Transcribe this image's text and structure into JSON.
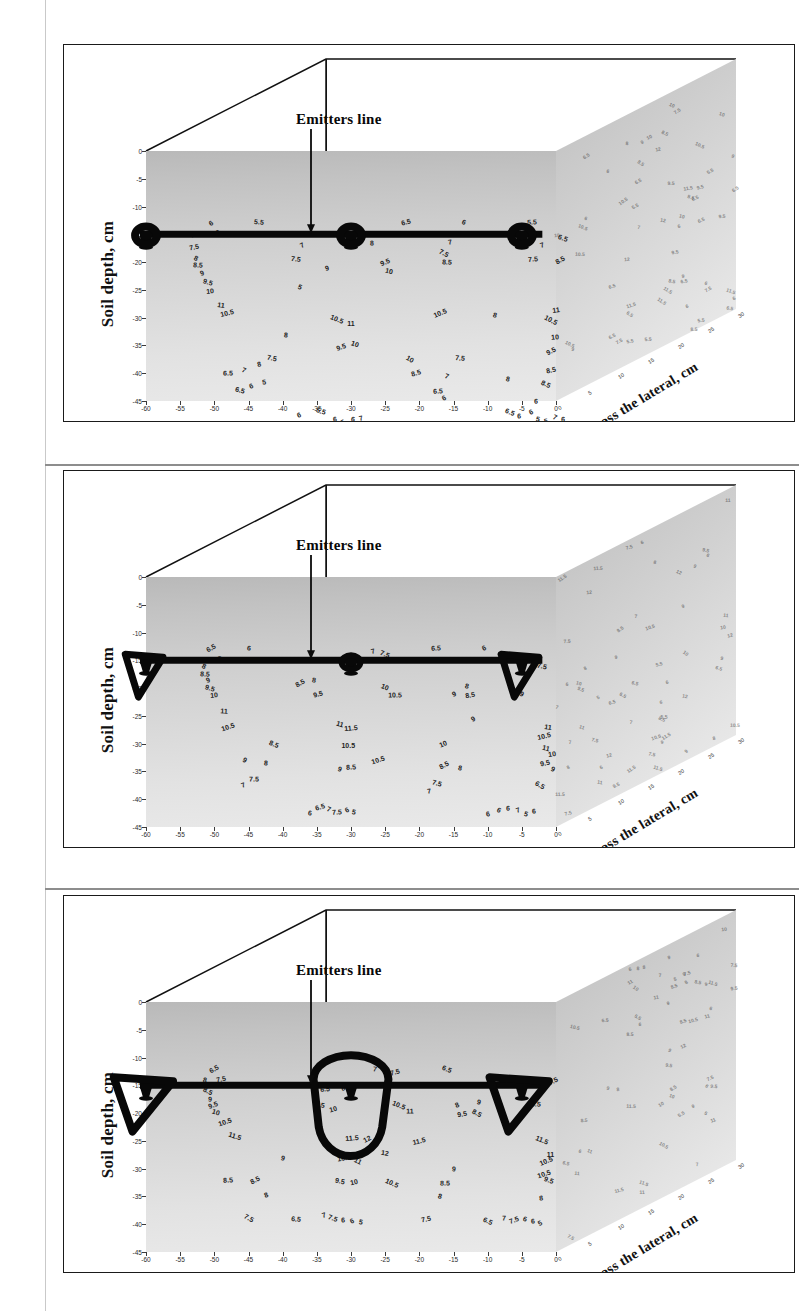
{
  "figure": {
    "type": "three-panel 3D soil moisture contour figure",
    "panel_count": 3
  },
  "axes": {
    "y_title": "Soil depth, cm",
    "x_title": "Distance, cm",
    "z_title": "Across the lateral, cm",
    "x_ticks": [
      "-60",
      "-55",
      "-50",
      "-45",
      "-40",
      "-35",
      "-30",
      "-25",
      "-20",
      "-15",
      "-10",
      "-5",
      "0"
    ],
    "x_values": [
      -60,
      -55,
      -50,
      -45,
      -40,
      -35,
      -30,
      -25,
      -20,
      -15,
      -10,
      -5,
      0
    ],
    "y_ticks": [
      "0",
      "-5",
      "-10",
      "-15",
      "-20",
      "-25",
      "-30",
      "-35",
      "-40",
      "-45"
    ],
    "y_values": [
      0,
      -5,
      -10,
      -15,
      -20,
      -25,
      -30,
      -35,
      -40,
      -45
    ],
    "z_ticks": [
      "0",
      "5",
      "10",
      "15",
      "20",
      "25",
      "30"
    ],
    "xlim": [
      -60,
      0
    ],
    "ylim": [
      -45,
      0
    ],
    "zlim": [
      0,
      30
    ]
  },
  "annotation": {
    "emitters_label": "Emitters line",
    "arrow": "down-arrow"
  },
  "chart_data": [
    {
      "type": "contour",
      "panel": 1,
      "title": "",
      "xlabel": "Distance, cm",
      "ylabel": "Soil depth, cm",
      "zlabel": "Across the lateral, cm",
      "xlim": [
        -60,
        0
      ],
      "ylim": [
        -45,
        0
      ],
      "grid": false,
      "emitter_depth_cm": -15,
      "emitter_positions_cm": [
        -60,
        -30,
        -5
      ],
      "contour_levels": [
        5.5,
        6,
        6.5,
        7,
        7.5,
        8,
        8.5,
        9,
        9.5,
        10,
        10.5,
        11
      ],
      "max_contour": 11,
      "bulb_size": "small",
      "labels": [
        {
          "t": "6",
          "x": 9.5,
          "y": 13.0
        },
        {
          "t": "5.5",
          "x": 16.5,
          "y": 12.7
        },
        {
          "t": "6.5",
          "x": 38.0,
          "y": 12.8
        },
        {
          "t": "6",
          "x": 46.5,
          "y": 12.8
        },
        {
          "t": "5.5",
          "x": 56.5,
          "y": 12.8
        },
        {
          "t": "7",
          "x": 6.8,
          "y": 15.2
        },
        {
          "t": "6.5",
          "x": 10.8,
          "y": 14.8
        },
        {
          "t": "7.5",
          "x": 7.0,
          "y": 17.2
        },
        {
          "t": "8",
          "x": 7.3,
          "y": 19.3
        },
        {
          "t": "8.5",
          "x": 7.6,
          "y": 20.6
        },
        {
          "t": "9",
          "x": 8.2,
          "y": 22.0
        },
        {
          "t": "9.5",
          "x": 9.0,
          "y": 23.6
        },
        {
          "t": "10",
          "x": 9.4,
          "y": 25.2
        },
        {
          "t": "7",
          "x": 22.8,
          "y": 17.0
        },
        {
          "t": "7.5",
          "x": 22.0,
          "y": 19.5
        },
        {
          "t": "9",
          "x": 26.5,
          "y": 21.0
        },
        {
          "t": "5",
          "x": 22.6,
          "y": 24.5
        },
        {
          "t": "8",
          "x": 33.0,
          "y": 16.6
        },
        {
          "t": "9.5",
          "x": 35.0,
          "y": 20.0
        },
        {
          "t": "10",
          "x": 35.6,
          "y": 21.6
        },
        {
          "t": "7",
          "x": 44.5,
          "y": 16.4
        },
        {
          "t": "7.5",
          "x": 43.6,
          "y": 18.4
        },
        {
          "t": "8.5",
          "x": 44.0,
          "y": 20.0
        },
        {
          "t": "7",
          "x": 58.0,
          "y": 17.0
        },
        {
          "t": "6.5",
          "x": 61.0,
          "y": 15.6
        },
        {
          "t": "7.5",
          "x": 56.6,
          "y": 19.4
        },
        {
          "t": "8.5",
          "x": 60.6,
          "y": 19.7
        },
        {
          "t": "11",
          "x": 11.0,
          "y": 27.8
        },
        {
          "t": "10.5",
          "x": 11.8,
          "y": 29.2
        },
        {
          "t": "10.5",
          "x": 28.0,
          "y": 30.3
        },
        {
          "t": "11",
          "x": 30.0,
          "y": 30.9
        },
        {
          "t": "10.5",
          "x": 43.0,
          "y": 29.2
        },
        {
          "t": "8",
          "x": 51.0,
          "y": 29.5
        },
        {
          "t": "11",
          "x": 60.0,
          "y": 28.6
        },
        {
          "t": "10.5",
          "x": 59.3,
          "y": 30.4
        },
        {
          "t": "8",
          "x": 20.5,
          "y": 33.2
        },
        {
          "t": "9.5",
          "x": 28.6,
          "y": 35.3
        },
        {
          "t": "10",
          "x": 30.6,
          "y": 34.8
        },
        {
          "t": "10",
          "x": 59.8,
          "y": 33.5
        },
        {
          "t": "9.5",
          "x": 59.2,
          "y": 36.0
        },
        {
          "t": "7.5",
          "x": 18.5,
          "y": 37.2
        },
        {
          "t": "8",
          "x": 16.5,
          "y": 38.4
        },
        {
          "t": "7",
          "x": 14.4,
          "y": 39.5
        },
        {
          "t": "6.5",
          "x": 12.0,
          "y": 40.0
        },
        {
          "t": "6",
          "x": 15.4,
          "y": 42.3
        },
        {
          "t": "6.5",
          "x": 13.8,
          "y": 43.0
        },
        {
          "t": "5",
          "x": 17.2,
          "y": 41.6
        },
        {
          "t": "10",
          "x": 38.6,
          "y": 37.5
        },
        {
          "t": "7.5",
          "x": 46.0,
          "y": 37.3
        },
        {
          "t": "8.5",
          "x": 39.5,
          "y": 40.0
        },
        {
          "t": "7",
          "x": 44.0,
          "y": 40.5
        },
        {
          "t": "6.5",
          "x": 42.8,
          "y": 43.2
        },
        {
          "t": "6",
          "x": 43.6,
          "y": 44.4
        },
        {
          "t": "8",
          "x": 53.0,
          "y": 41.0
        },
        {
          "t": "8.5",
          "x": 59.3,
          "y": 39.5
        },
        {
          "t": "8.5",
          "x": 58.5,
          "y": 42.0
        },
        {
          "t": "6",
          "x": 57.0,
          "y": 45.0
        },
        {
          "t": "6",
          "x": 22.4,
          "y": 47.5
        },
        {
          "t": "5.5",
          "x": 25.6,
          "y": 46.8
        },
        {
          "t": "6",
          "x": 27.6,
          "y": 48.3
        },
        {
          "t": "5",
          "x": 28.8,
          "y": 48.8
        },
        {
          "t": "6",
          "x": 30.3,
          "y": 48.2
        },
        {
          "t": "7",
          "x": 31.5,
          "y": 48.0
        },
        {
          "t": "6.5",
          "x": 53.2,
          "y": 47.0
        },
        {
          "t": "6",
          "x": 54.6,
          "y": 47.7
        },
        {
          "t": "6",
          "x": 56.4,
          "y": 46.9
        },
        {
          "t": "5",
          "x": 57.4,
          "y": 48.3
        },
        {
          "t": "5",
          "x": 58.6,
          "y": 48.6
        },
        {
          "t": "7",
          "x": 59.8,
          "y": 47.8
        },
        {
          "t": "6",
          "x": 61.0,
          "y": 48.2
        }
      ]
    },
    {
      "type": "contour",
      "panel": 2,
      "title": "",
      "xlabel": "Distance, cm",
      "ylabel": "Soil depth, cm",
      "zlabel": "Across the lateral, cm",
      "xlim": [
        -60,
        0
      ],
      "ylim": [
        -45,
        0
      ],
      "grid": false,
      "emitter_depth_cm": -15,
      "emitter_positions_cm": [
        -60,
        -30,
        -5
      ],
      "contour_levels": [
        5.5,
        6,
        6.5,
        7,
        7.5,
        8,
        8.5,
        9,
        9.5,
        10,
        10.5,
        11,
        11.5
      ],
      "max_contour": 11.5,
      "bulb_size": "medium",
      "labels": [
        {
          "t": "6.5",
          "x": 9.5,
          "y": 12.8
        },
        {
          "t": "6",
          "x": 15.0,
          "y": 12.7
        },
        {
          "t": "7",
          "x": 33.2,
          "y": 13.3
        },
        {
          "t": "7.5",
          "x": 35.0,
          "y": 13.9
        },
        {
          "t": "6.5",
          "x": 42.5,
          "y": 12.8
        },
        {
          "t": "6",
          "x": 49.5,
          "y": 12.8
        },
        {
          "t": "7.5",
          "x": 58.0,
          "y": 16.0
        },
        {
          "t": "7.5",
          "x": 10.4,
          "y": 14.7
        },
        {
          "t": "8",
          "x": 8.5,
          "y": 16.0
        },
        {
          "t": "8.5",
          "x": 8.6,
          "y": 17.4
        },
        {
          "t": "9",
          "x": 9.0,
          "y": 18.6
        },
        {
          "t": "9.5",
          "x": 9.4,
          "y": 20.0
        },
        {
          "t": "10",
          "x": 9.9,
          "y": 21.3
        },
        {
          "t": "8.5",
          "x": 22.6,
          "y": 19.0
        },
        {
          "t": "8",
          "x": 24.6,
          "y": 18.5
        },
        {
          "t": "9.5",
          "x": 25.2,
          "y": 21.0
        },
        {
          "t": "10",
          "x": 35.0,
          "y": 19.8
        },
        {
          "t": "10.5",
          "x": 36.5,
          "y": 21.3
        },
        {
          "t": "9",
          "x": 45.0,
          "y": 21.0
        },
        {
          "t": "8",
          "x": 47.0,
          "y": 19.6
        },
        {
          "t": "8.5",
          "x": 47.4,
          "y": 21.2
        },
        {
          "t": "9",
          "x": 55.0,
          "y": 21.0
        },
        {
          "t": "11",
          "x": 11.4,
          "y": 24.2
        },
        {
          "t": "10.5",
          "x": 12.0,
          "y": 27.0
        },
        {
          "t": "11",
          "x": 28.4,
          "y": 26.5
        },
        {
          "t": "11.5",
          "x": 30.0,
          "y": 27.2
        },
        {
          "t": "9",
          "x": 47.8,
          "y": 25.5
        },
        {
          "t": "11",
          "x": 58.9,
          "y": 27.0
        },
        {
          "t": "10.5",
          "x": 58.2,
          "y": 28.6
        },
        {
          "t": "8.5",
          "x": 18.8,
          "y": 30.0
        },
        {
          "t": "10.5",
          "x": 29.6,
          "y": 30.3
        },
        {
          "t": "10",
          "x": 43.5,
          "y": 30.0
        },
        {
          "t": "11",
          "x": 58.6,
          "y": 30.8
        },
        {
          "t": "10",
          "x": 59.4,
          "y": 31.8
        },
        {
          "t": "9",
          "x": 14.5,
          "y": 33.0
        },
        {
          "t": "8",
          "x": 17.5,
          "y": 33.4
        },
        {
          "t": "10.5",
          "x": 34.0,
          "y": 33.0
        },
        {
          "t": "9",
          "x": 28.4,
          "y": 34.6
        },
        {
          "t": "8.5",
          "x": 30.0,
          "y": 34.2
        },
        {
          "t": "8.5",
          "x": 43.6,
          "y": 33.8
        },
        {
          "t": "8",
          "x": 46.0,
          "y": 34.3
        },
        {
          "t": "9.5",
          "x": 58.4,
          "y": 33.5
        },
        {
          "t": "9",
          "x": 59.6,
          "y": 34.6
        },
        {
          "t": "7.5",
          "x": 15.8,
          "y": 36.3
        },
        {
          "t": "7",
          "x": 14.2,
          "y": 37.5
        },
        {
          "t": "7.5",
          "x": 42.6,
          "y": 37.0
        },
        {
          "t": "7",
          "x": 41.4,
          "y": 38.6
        },
        {
          "t": "6.5",
          "x": 57.6,
          "y": 37.5
        },
        {
          "t": "6",
          "x": 24.0,
          "y": 42.5
        },
        {
          "t": "6.5",
          "x": 25.4,
          "y": 41.4
        },
        {
          "t": "7",
          "x": 26.8,
          "y": 41.8
        },
        {
          "t": "7.5",
          "x": 28.0,
          "y": 42.3
        },
        {
          "t": "6",
          "x": 29.4,
          "y": 42.0
        },
        {
          "t": "5",
          "x": 30.5,
          "y": 42.3
        },
        {
          "t": "6",
          "x": 50.0,
          "y": 42.6
        },
        {
          "t": "6",
          "x": 51.6,
          "y": 42.0
        },
        {
          "t": "6",
          "x": 53.0,
          "y": 41.6
        },
        {
          "t": "7",
          "x": 54.4,
          "y": 42.0
        },
        {
          "t": "5",
          "x": 55.6,
          "y": 42.6
        },
        {
          "t": "6",
          "x": 56.8,
          "y": 42.2
        }
      ]
    },
    {
      "type": "contour",
      "panel": 3,
      "title": "",
      "xlabel": "Distance, cm",
      "ylabel": "Soil depth, cm",
      "zlabel": "Across the lateral, cm",
      "xlim": [
        -60,
        0
      ],
      "ylim": [
        -45,
        0
      ],
      "grid": false,
      "emitter_depth_cm": -15,
      "emitter_positions_cm": [
        -60,
        -30,
        -5
      ],
      "contour_levels": [
        6.5,
        7,
        7.5,
        8,
        8.5,
        9,
        9.5,
        10,
        10.5,
        11,
        11.5,
        12
      ],
      "max_contour": 12,
      "bulb_size": "large",
      "labels": [
        {
          "t": "6.5",
          "x": 10.0,
          "y": 12.0
        },
        {
          "t": "7",
          "x": 33.5,
          "y": 12.0
        },
        {
          "t": "7.5",
          "x": 36.5,
          "y": 12.6
        },
        {
          "t": "6.5",
          "x": 44.0,
          "y": 12.0
        },
        {
          "t": "7",
          "x": 56.0,
          "y": 14.0
        },
        {
          "t": "7.5",
          "x": 59.5,
          "y": 14.2
        },
        {
          "t": "8",
          "x": 8.6,
          "y": 14.0
        },
        {
          "t": "7.5",
          "x": 11.0,
          "y": 13.8
        },
        {
          "t": "8.5",
          "x": 9.0,
          "y": 16.0
        },
        {
          "t": "9",
          "x": 9.4,
          "y": 17.4
        },
        {
          "t": "9.5",
          "x": 9.8,
          "y": 18.6
        },
        {
          "t": "10",
          "x": 10.2,
          "y": 19.8
        },
        {
          "t": "6.5",
          "x": 26.2,
          "y": 15.6
        },
        {
          "t": "8",
          "x": 28.8,
          "y": 15.4
        },
        {
          "t": "9.5",
          "x": 25.4,
          "y": 18.6
        },
        {
          "t": "10",
          "x": 27.4,
          "y": 19.2
        },
        {
          "t": "10.5",
          "x": 37.0,
          "y": 18.6
        },
        {
          "t": "11",
          "x": 38.6,
          "y": 19.6
        },
        {
          "t": "8",
          "x": 45.5,
          "y": 18.6
        },
        {
          "t": "9",
          "x": 48.8,
          "y": 18.0
        },
        {
          "t": "9.5",
          "x": 46.2,
          "y": 20.2
        },
        {
          "t": "8.5",
          "x": 48.4,
          "y": 20.0
        },
        {
          "t": "9.5",
          "x": 57.0,
          "y": 18.4
        },
        {
          "t": "10.5",
          "x": 11.6,
          "y": 21.6
        },
        {
          "t": "11.5",
          "x": 13.0,
          "y": 24.2
        },
        {
          "t": "11.5",
          "x": 30.2,
          "y": 24.4
        },
        {
          "t": "12",
          "x": 32.4,
          "y": 24.6
        },
        {
          "t": "12",
          "x": 35.0,
          "y": 27.2
        },
        {
          "t": "11.5",
          "x": 40.0,
          "y": 25.0
        },
        {
          "t": "11.5",
          "x": 58.0,
          "y": 24.8
        },
        {
          "t": "11",
          "x": 59.2,
          "y": 27.4
        },
        {
          "t": "10.5",
          "x": 58.6,
          "y": 28.6
        },
        {
          "t": "9",
          "x": 20.0,
          "y": 28.0
        },
        {
          "t": "10.5",
          "x": 29.0,
          "y": 28.0
        },
        {
          "t": "11",
          "x": 31.0,
          "y": 28.6
        },
        {
          "t": "9",
          "x": 45.0,
          "y": 30.0
        },
        {
          "t": "10.5",
          "x": 58.2,
          "y": 31.0
        },
        {
          "t": "9.5",
          "x": 59.0,
          "y": 32.0
        },
        {
          "t": "8.5",
          "x": 12.0,
          "y": 32.0
        },
        {
          "t": "8.5",
          "x": 16.0,
          "y": 32.0
        },
        {
          "t": "9.5",
          "x": 28.4,
          "y": 32.2
        },
        {
          "t": "10",
          "x": 30.4,
          "y": 32.4
        },
        {
          "t": "10.5",
          "x": 36.0,
          "y": 32.6
        },
        {
          "t": "8.5",
          "x": 43.8,
          "y": 32.5
        },
        {
          "t": "8",
          "x": 17.5,
          "y": 34.8
        },
        {
          "t": "8",
          "x": 43.0,
          "y": 35.0
        },
        {
          "t": "8",
          "x": 57.8,
          "y": 35.2
        },
        {
          "t": "7.5",
          "x": 15.0,
          "y": 38.8
        },
        {
          "t": "6.5",
          "x": 22.0,
          "y": 39.0
        },
        {
          "t": "7",
          "x": 26.0,
          "y": 38.4
        },
        {
          "t": "7.5",
          "x": 27.4,
          "y": 38.8
        },
        {
          "t": "6",
          "x": 28.8,
          "y": 39.2
        },
        {
          "t": "6",
          "x": 30.2,
          "y": 39.4
        },
        {
          "t": "5",
          "x": 31.4,
          "y": 39.6
        },
        {
          "t": "7.5",
          "x": 41.0,
          "y": 39.0
        },
        {
          "t": "6.5",
          "x": 50.0,
          "y": 39.4
        },
        {
          "t": "7",
          "x": 52.4,
          "y": 38.8
        },
        {
          "t": "7.5",
          "x": 53.8,
          "y": 39.2
        },
        {
          "t": "6",
          "x": 55.4,
          "y": 39.0
        },
        {
          "t": "6",
          "x": 56.6,
          "y": 39.4
        },
        {
          "t": "5",
          "x": 57.6,
          "y": 39.8
        }
      ]
    }
  ]
}
